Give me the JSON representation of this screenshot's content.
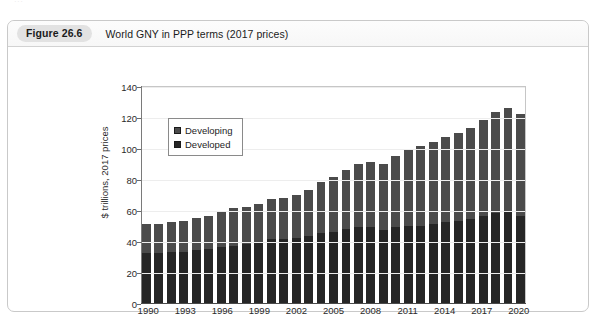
{
  "page": {
    "cut_off_header_text": "···"
  },
  "figure": {
    "badge": "Figure 26.6",
    "title": "World GNY in PPP terms (2017 prices)"
  },
  "chart_data": {
    "type": "bar",
    "stacked": true,
    "title": "World GNY in PPP terms (2017 prices)",
    "xlabel": "",
    "ylabel": "$ trillions, 2017 prices",
    "ylim": [
      0,
      140
    ],
    "ytick_step": 20,
    "yticks": [
      0,
      20,
      40,
      60,
      80,
      100,
      120,
      140
    ],
    "grid": true,
    "legend_position": "top-left-inside",
    "categories": [
      "1990",
      "1991",
      "1992",
      "1993",
      "1994",
      "1995",
      "1996",
      "1997",
      "1998",
      "1999",
      "2000",
      "2001",
      "2002",
      "2003",
      "2004",
      "2005",
      "2006",
      "2007",
      "2008",
      "2009",
      "2010",
      "2011",
      "2012",
      "2013",
      "2014",
      "2015",
      "2016",
      "2017",
      "2018",
      "2019",
      "2020"
    ],
    "xtick_labels": [
      "1990",
      "1993",
      "1996",
      "1999",
      "2002",
      "2005",
      "2008",
      "2011",
      "2014",
      "2017",
      "2020"
    ],
    "series": [
      {
        "name": "Developed",
        "color": "#262626",
        "values": [
          32,
          32,
          33,
          33,
          34,
          35,
          36,
          37,
          38,
          39,
          41,
          41,
          42,
          43,
          45,
          46,
          48,
          49,
          49,
          47,
          49,
          50,
          50,
          51,
          52,
          53,
          54,
          56,
          58,
          59,
          56
        ]
      },
      {
        "name": "Developing",
        "color": "#4b4b4b",
        "values": [
          19,
          19,
          19,
          20,
          21,
          21,
          23,
          24,
          24,
          25,
          26,
          27,
          28,
          30,
          33,
          35,
          38,
          41,
          42,
          43,
          46,
          49,
          51,
          53,
          55,
          57,
          59,
          62,
          65,
          67,
          66
        ]
      }
    ],
    "totals": [
      51,
      51,
      52,
      53,
      55,
      56,
      59,
      61,
      62,
      64,
      67,
      68,
      70,
      73,
      78,
      81,
      86,
      90,
      91,
      90,
      95,
      99,
      101,
      104,
      107,
      110,
      113,
      118,
      123,
      126,
      122
    ]
  },
  "legend": {
    "items": [
      {
        "label": "Developing",
        "color": "#4b4b4b"
      },
      {
        "label": "Developed",
        "color": "#262626"
      }
    ]
  }
}
